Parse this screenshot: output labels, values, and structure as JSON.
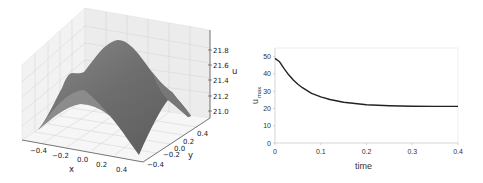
{
  "chart_data": [
    {
      "type": "surface3d",
      "title": "",
      "xlabel": "x",
      "ylabel": "y",
      "zlabel": "u",
      "x_ticks": [
        "-0.4",
        "-0.2",
        "0.0",
        "0.2",
        "0.4"
      ],
      "y_ticks": [
        "-0.4",
        "-0.2",
        "0.0",
        "0.2",
        "0.4"
      ],
      "z_ticks": [
        "21.0",
        "21.2",
        "21.4",
        "21.6",
        "21.8"
      ],
      "xlim": [
        -0.5,
        0.5
      ],
      "ylim": [
        -0.5,
        0.5
      ],
      "zlim": [
        20.95,
        21.9
      ],
      "description": "Smooth dome-shaped surface peaking near 21.9 at the center (x=0, y=0), falling toward about 21.0 at the boundaries; grey shading",
      "grid": true
    },
    {
      "type": "line",
      "title": "",
      "xlabel": "time",
      "ylabel": "u_max",
      "x_ticks": [
        "0",
        "0.1",
        "0.2",
        "0.3",
        "0.4"
      ],
      "y_ticks": [
        "0",
        "10",
        "20",
        "30",
        "40",
        "50"
      ],
      "xlim": [
        0,
        0.4
      ],
      "ylim": [
        0,
        55
      ],
      "grid": false,
      "series": [
        {
          "name": "u_max",
          "color": "#222222",
          "x": [
            0,
            0.01,
            0.02,
            0.03,
            0.04,
            0.05,
            0.06,
            0.08,
            0.1,
            0.12,
            0.15,
            0.2,
            0.25,
            0.3,
            0.35,
            0.4
          ],
          "y": [
            49,
            47,
            43,
            39.5,
            36.5,
            34,
            32,
            28.8,
            26.7,
            25.2,
            23.6,
            22.2,
            21.6,
            21.3,
            21.2,
            21.2
          ]
        }
      ]
    }
  ],
  "labels": {
    "left_x": "x",
    "left_y": "y",
    "left_z": "u",
    "right_x": "time",
    "right_y_main": "u",
    "right_y_sub": "max"
  }
}
